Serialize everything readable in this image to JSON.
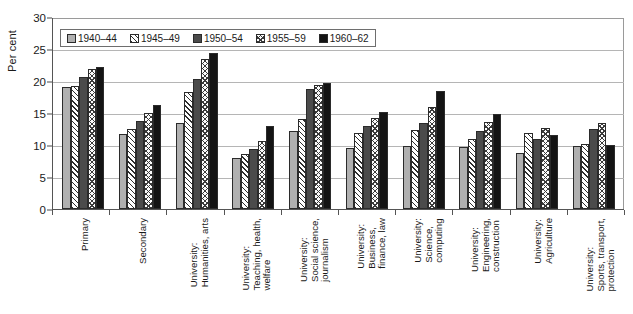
{
  "chart_data": {
    "type": "bar",
    "title": "",
    "subtitle": "",
    "xlabel": "",
    "ylabel": "Per cent",
    "ylim": [
      0,
      30
    ],
    "yticks": [
      0,
      5,
      10,
      15,
      20,
      25,
      30
    ],
    "ytick_labels": [
      "0",
      "5",
      "10",
      "15",
      "20",
      "25",
      "30"
    ],
    "grid": true,
    "grid_axis": "y",
    "legend_position": "top-left-inside",
    "categories": [
      "Primary",
      "Secondary",
      "University: Humanities, arts",
      "University: Teaching, health, welfare",
      "University: Social science, journalism",
      "University: Business, finance, law",
      "University: Science, computing",
      "University: Engineering, construction",
      "University: Agriculture",
      "University: Sports, transport, protection"
    ],
    "category_lines": [
      [
        "Primary"
      ],
      [
        "Secondary"
      ],
      [
        "University:",
        "Humanities, arts"
      ],
      [
        "University:",
        "Teaching, health,",
        "welfare"
      ],
      [
        "University:",
        "Social science,",
        "journalism"
      ],
      [
        "University:",
        "Business,",
        "finance, law"
      ],
      [
        "University:",
        "Science,",
        "computing"
      ],
      [
        "University:",
        "Engineering,",
        "construction"
      ],
      [
        "University:",
        "Agriculture"
      ],
      [
        "University:",
        "Sports, transport,",
        "protection"
      ]
    ],
    "series": [
      {
        "name": "1940–44",
        "pattern": "solid-light-gray",
        "color": "#b0b0b0",
        "values": [
          19.1,
          11.7,
          13.5,
          8.0,
          12.2,
          9.5,
          9.8,
          9.7,
          8.7,
          9.9
        ]
      },
      {
        "name": "1945–49",
        "pattern": "diagonal-hatch",
        "color": "#ffffff",
        "values": [
          19.2,
          12.5,
          18.3,
          8.6,
          14.1,
          11.8,
          12.4,
          11.0,
          11.9,
          10.2
        ]
      },
      {
        "name": "1950–54",
        "pattern": "solid-dark-gray",
        "color": "#4b4b4b",
        "values": [
          20.6,
          13.8,
          20.3,
          9.4,
          18.7,
          13.0,
          13.4,
          12.2,
          11.0,
          12.5
        ]
      },
      {
        "name": "1955–59",
        "pattern": "cross-hatch",
        "color": "#fbfbfb",
        "values": [
          21.8,
          15.0,
          23.4,
          10.6,
          19.4,
          14.2,
          16.0,
          13.6,
          12.7,
          13.4
        ]
      },
      {
        "name": "1960–62",
        "pattern": "solid-black",
        "color": "#141414",
        "values": [
          22.2,
          16.3,
          24.4,
          13.0,
          19.7,
          15.1,
          18.5,
          14.9,
          11.6,
          10.0
        ]
      }
    ]
  }
}
